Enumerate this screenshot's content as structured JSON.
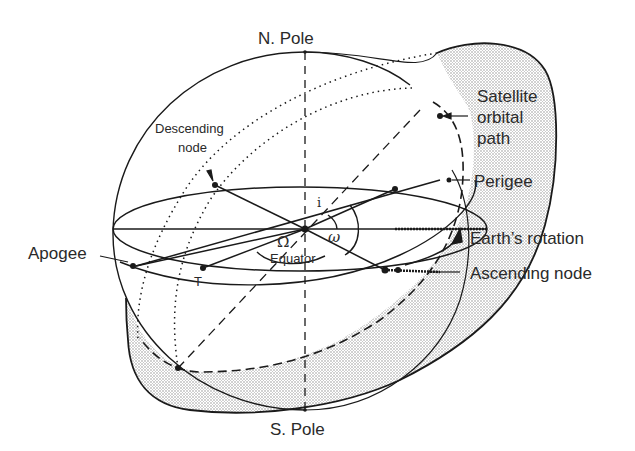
{
  "diagram": {
    "labels": {
      "north_pole": "N. Pole",
      "south_pole": "S. Pole",
      "satellite_path_line1": "Satellite",
      "satellite_path_line2": "orbital",
      "satellite_path_line3": "path",
      "perigee": "Perigee",
      "earth_rotation": "Earth’s rotation",
      "ascending_node": "Ascending node",
      "apogee": "Apogee",
      "descending_node_line1": "Descending",
      "descending_node_line2": "node",
      "equator": "Equator",
      "inclination": "i",
      "argument_of_perigee": "ω",
      "right_ascension": "Ω",
      "true_anomaly_point": "T"
    },
    "colors": {
      "ink": "#1a1a1a",
      "shading": "#c8c8c8",
      "background": "#ffffff"
    }
  }
}
